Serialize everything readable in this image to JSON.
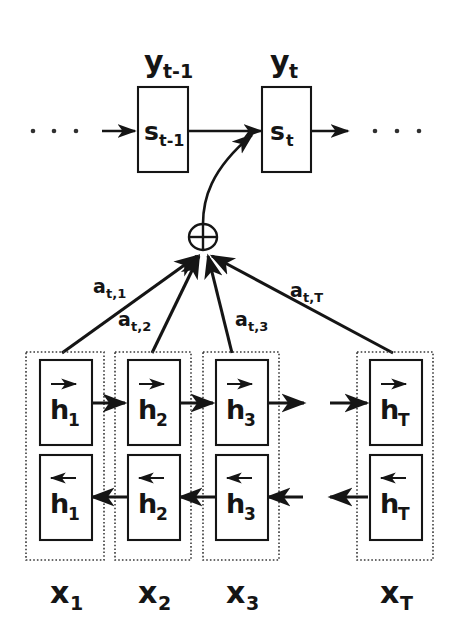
{
  "figure": {
    "background_color": "#ffffff",
    "ink_color": "#151515",
    "dotted_color": "#3a3a3a"
  },
  "decoder": {
    "outputs": [
      {
        "id": "y-prev",
        "base": "y",
        "sub": "t-1"
      },
      {
        "id": "y-cur",
        "base": "y",
        "sub": "t"
      }
    ],
    "states": [
      {
        "id": "s-prev",
        "base": "s",
        "sub": "t-1"
      },
      {
        "id": "s-cur",
        "base": "s",
        "sub": "t"
      }
    ],
    "left_ellipsis": "· · ·",
    "right_ellipsis": "· · ·"
  },
  "context": {
    "node_symbol": "+",
    "node_name": "sum-node",
    "weights": [
      {
        "id": "a1",
        "base": "a",
        "sub": "t,1"
      },
      {
        "id": "a2",
        "base": "a",
        "sub": "t,2"
      },
      {
        "id": "a3",
        "base": "a",
        "sub": "t,3"
      },
      {
        "id": "aT",
        "base": "a",
        "sub": "t,T"
      }
    ]
  },
  "encoder": {
    "columns": [
      {
        "id": "col-1",
        "input": {
          "base": "x",
          "sub": "1"
        },
        "forward": {
          "base": "h",
          "sub": "1",
          "direction": "forward"
        },
        "backward": {
          "base": "h",
          "sub": "1",
          "direction": "backward"
        }
      },
      {
        "id": "col-2",
        "input": {
          "base": "x",
          "sub": "2"
        },
        "forward": {
          "base": "h",
          "sub": "2",
          "direction": "forward"
        },
        "backward": {
          "base": "h",
          "sub": "2",
          "direction": "backward"
        }
      },
      {
        "id": "col-3",
        "input": {
          "base": "x",
          "sub": "3"
        },
        "forward": {
          "base": "h",
          "sub": "3",
          "direction": "forward"
        },
        "backward": {
          "base": "h",
          "sub": "3",
          "direction": "backward"
        }
      },
      {
        "id": "col-T",
        "input": {
          "base": "x",
          "sub": "T"
        },
        "forward": {
          "base": "h",
          "sub": "T",
          "direction": "forward"
        },
        "backward": {
          "base": "h",
          "sub": "T",
          "direction": "backward"
        }
      }
    ]
  }
}
